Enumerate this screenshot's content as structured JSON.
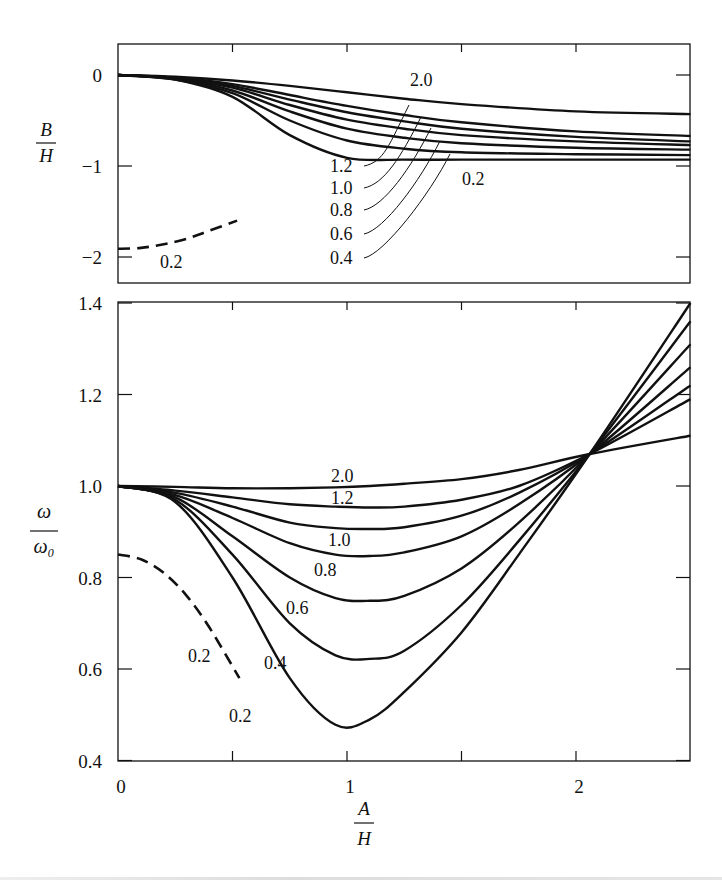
{
  "figure": {
    "top_panel": {
      "ylabel_num": "B",
      "ylabel_den": "H",
      "yticks": [
        {
          "v": 0,
          "label": "0"
        },
        {
          "v": -1,
          "label": "−1"
        },
        {
          "v": -2,
          "label": "−2"
        }
      ],
      "series_labels": [
        "2.0",
        "1.2",
        "1.0",
        "0.8",
        "0.6",
        "0.4",
        "0.2"
      ],
      "dashed_label": "0.2"
    },
    "bottom_panel": {
      "ylabel_num": "ω",
      "ylabel_den": "ω₀",
      "yticks": [
        {
          "v": 1.4,
          "label": "1.4"
        },
        {
          "v": 1.2,
          "label": "1.2"
        },
        {
          "v": 1.0,
          "label": "1.0"
        },
        {
          "v": 0.8,
          "label": "0.8"
        },
        {
          "v": 0.6,
          "label": "0.6"
        },
        {
          "v": 0.4,
          "label": "0.4"
        }
      ],
      "series_labels": [
        "2.0",
        "1.2",
        "1.0",
        "0.8",
        "0.6",
        "0.4",
        "0.2"
      ],
      "dashed_label": "0.2"
    },
    "xlabel_num": "A",
    "xlabel_den": "H",
    "xticks": [
      {
        "v": 0,
        "label": "0"
      },
      {
        "v": 1,
        "label": "1"
      },
      {
        "v": 2,
        "label": "2"
      }
    ]
  },
  "chart_data": [
    {
      "type": "line",
      "title": "",
      "xlabel": "A/H",
      "ylabel": "B/H",
      "xlim": [
        0,
        2.5
      ],
      "ylim": [
        -2.3,
        0.35
      ],
      "grid": false,
      "legend": "inline labels with leader lines",
      "x": [
        0,
        0.25,
        0.5,
        0.75,
        1.0,
        1.25,
        1.5,
        2.0,
        2.5
      ],
      "series": [
        {
          "name": "2.0",
          "style": "solid",
          "values": [
            0,
            -0.02,
            -0.06,
            -0.12,
            -0.19,
            -0.26,
            -0.32,
            -0.4,
            -0.43
          ]
        },
        {
          "name": "1.2",
          "style": "solid",
          "values": [
            0,
            -0.03,
            -0.1,
            -0.22,
            -0.34,
            -0.44,
            -0.52,
            -0.62,
            -0.67
          ]
        },
        {
          "name": "1.0",
          "style": "solid",
          "values": [
            0,
            -0.03,
            -0.12,
            -0.27,
            -0.41,
            -0.51,
            -0.59,
            -0.68,
            -0.73
          ]
        },
        {
          "name": "0.8",
          "style": "solid",
          "values": [
            0,
            -0.04,
            -0.14,
            -0.33,
            -0.49,
            -0.59,
            -0.66,
            -0.73,
            -0.77
          ]
        },
        {
          "name": "0.6",
          "style": "solid",
          "values": [
            0,
            -0.04,
            -0.17,
            -0.4,
            -0.59,
            -0.69,
            -0.75,
            -0.8,
            -0.82
          ]
        },
        {
          "name": "0.4",
          "style": "solid",
          "values": [
            0,
            -0.05,
            -0.2,
            -0.5,
            -0.72,
            -0.81,
            -0.85,
            -0.87,
            -0.88
          ]
        },
        {
          "name": "0.2",
          "style": "solid",
          "values": [
            0,
            -0.05,
            -0.24,
            -0.66,
            -0.91,
            -0.93,
            -0.93,
            -0.93,
            -0.93
          ]
        },
        {
          "name": "0.2 (dashed)",
          "style": "dashed",
          "x": [
            0,
            0.1,
            0.2,
            0.3,
            0.4,
            0.52
          ],
          "values": [
            -1.91,
            -1.9,
            -1.86,
            -1.8,
            -1.71,
            -1.6
          ]
        }
      ]
    },
    {
      "type": "line",
      "title": "",
      "xlabel": "A/H",
      "ylabel": "ω/ω₀",
      "xlim": [
        0,
        2.5
      ],
      "ylim": [
        0.4,
        1.4
      ],
      "grid": false,
      "legend": "inline labels",
      "x": [
        0,
        0.25,
        0.5,
        0.75,
        0.95,
        1.1,
        1.25,
        1.5,
        1.75,
        2.06,
        2.5
      ],
      "series": [
        {
          "name": "2.0",
          "style": "solid",
          "values": [
            1.0,
            0.998,
            0.995,
            0.995,
            0.997,
            1.0,
            1.005,
            1.015,
            1.035,
            1.07,
            1.11
          ]
        },
        {
          "name": "1.2",
          "style": "solid",
          "values": [
            1.0,
            0.99,
            0.975,
            0.96,
            0.955,
            0.953,
            0.955,
            0.97,
            1.0,
            1.07,
            1.19
          ]
        },
        {
          "name": "1.0",
          "style": "solid",
          "values": [
            1.0,
            0.985,
            0.955,
            0.92,
            0.908,
            0.906,
            0.91,
            0.935,
            0.985,
            1.07,
            1.22
          ]
        },
        {
          "name": "0.8",
          "style": "solid",
          "values": [
            1.0,
            0.98,
            0.93,
            0.875,
            0.85,
            0.847,
            0.855,
            0.89,
            0.96,
            1.07,
            1.26
          ]
        },
        {
          "name": "0.6",
          "style": "solid",
          "values": [
            1.0,
            0.975,
            0.89,
            0.8,
            0.755,
            0.749,
            0.76,
            0.82,
            0.92,
            1.07,
            1.31
          ]
        },
        {
          "name": "0.4",
          "style": "solid",
          "values": [
            1.0,
            0.97,
            0.85,
            0.7,
            0.63,
            0.622,
            0.64,
            0.74,
            0.88,
            1.07,
            1.36
          ]
        },
        {
          "name": "0.2",
          "style": "solid",
          "values": [
            1.0,
            0.965,
            0.8,
            0.58,
            0.478,
            0.49,
            0.55,
            0.68,
            0.85,
            1.07,
            1.4
          ]
        },
        {
          "name": "0.2 (dashed)",
          "style": "dashed",
          "x": [
            0,
            0.1,
            0.2,
            0.3,
            0.4,
            0.53
          ],
          "values": [
            0.85,
            0.84,
            0.81,
            0.76,
            0.69,
            0.58
          ]
        }
      ],
      "annotations": [
        "All solid curves intersect near A/H ≈ 2.06, ω/ω₀ ≈ 1.07"
      ]
    }
  ]
}
